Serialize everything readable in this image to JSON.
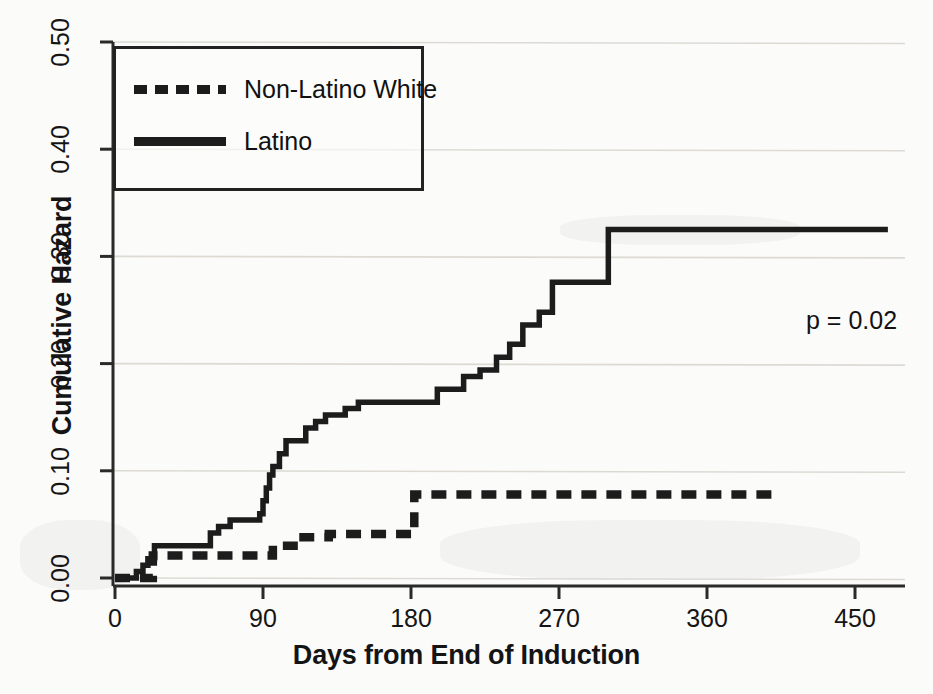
{
  "chart_data": {
    "type": "line",
    "title": "",
    "subtitle": "",
    "xlabel": "Days from End of Induction",
    "ylabel": "Cumulative Hazard",
    "xlim": [
      0,
      480
    ],
    "ylim": [
      0.0,
      0.5
    ],
    "xticks": [
      0,
      90,
      180,
      270,
      360,
      450
    ],
    "xtick_labels": [
      "0",
      "90",
      "180",
      "270",
      "360",
      "450"
    ],
    "yticks": [
      0.0,
      0.1,
      0.2,
      0.3,
      0.4,
      0.5
    ],
    "ytick_labels": [
      "0.00",
      "0.10",
      "0.20",
      "0.30",
      "0.40",
      "0.50"
    ],
    "grid": "horizontal",
    "legend_position": "top-left",
    "step_style": "post",
    "annotations": [
      {
        "name": "p-value",
        "text": "p = 0.02",
        "x": 440,
        "y": 0.215
      }
    ],
    "series": [
      {
        "name": "Non-Latino White",
        "style": "dashed",
        "color": "#1c1c1c",
        "x": [
          0,
          10,
          22,
          23,
          38,
          92,
          96,
          112,
          130,
          150,
          178,
          182,
          240,
          405
        ],
        "y": [
          0.0,
          0.0,
          0.0,
          0.021,
          0.021,
          0.021,
          0.03,
          0.038,
          0.041,
          0.041,
          0.041,
          0.078,
          0.078,
          0.078
        ]
      },
      {
        "name": "Latino",
        "style": "solid",
        "color": "#1c1c1c",
        "x": [
          0,
          9,
          13,
          17,
          20,
          24,
          30,
          54,
          58,
          63,
          70,
          84,
          88,
          90,
          92,
          94,
          96,
          100,
          104,
          110,
          116,
          122,
          128,
          134,
          140,
          148,
          160,
          175,
          196,
          212,
          222,
          232,
          240,
          248,
          258,
          266,
          300,
          470
        ],
        "y": [
          0.0,
          0.0,
          0.006,
          0.012,
          0.018,
          0.03,
          0.03,
          0.03,
          0.042,
          0.048,
          0.054,
          0.054,
          0.06,
          0.072,
          0.084,
          0.096,
          0.104,
          0.116,
          0.128,
          0.128,
          0.14,
          0.146,
          0.152,
          0.152,
          0.158,
          0.164,
          0.164,
          0.164,
          0.176,
          0.188,
          0.194,
          0.206,
          0.218,
          0.236,
          0.248,
          0.276,
          0.325,
          0.325
        ]
      }
    ]
  },
  "legend": {
    "entries": [
      {
        "label": "Non-Latino White",
        "style": "dashed"
      },
      {
        "label": "Latino",
        "style": "solid"
      }
    ]
  },
  "colors": {
    "line": "#1c1c1c",
    "axis": "#2a2a2a",
    "grid": "#dddad4",
    "background": "#fbfbf9"
  }
}
